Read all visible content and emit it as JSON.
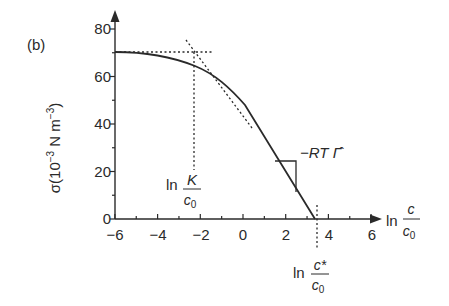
{
  "panel_label": "(b)",
  "chart_data": {
    "type": "line",
    "title": "",
    "xlabel": "ln c/c0",
    "ylabel": "σ(10^-3 N m^-3)",
    "xlim": [
      -6,
      7
    ],
    "ylim": [
      0,
      85
    ],
    "grid": false,
    "x_ticks": [
      -6,
      -4,
      -2,
      0,
      2,
      4,
      6
    ],
    "y_ticks": [
      0,
      20,
      40,
      60,
      80
    ],
    "series": [
      {
        "name": "sigma",
        "style": "solid",
        "x": [
          -6.0,
          -5.0,
          -4.0,
          -3.0,
          -2.3,
          -1.5,
          -1.0,
          0.0,
          1.0,
          2.0,
          2.5,
          3.3
        ],
        "y": [
          70.0,
          69.6,
          68.0,
          64.8,
          61.0,
          55.0,
          50.0,
          39.0,
          28.0,
          17.3,
          12.0,
          0.0
        ]
      },
      {
        "name": "plateau (sigma0)",
        "style": "dotted",
        "x": [
          -6.0,
          -1.4
        ],
        "y": [
          70.0,
          70.0
        ]
      },
      {
        "name": "tangent (slope -RT Γ̂)",
        "style": "dotted",
        "x": [
          -2.65,
          0.3
        ],
        "y": [
          75.0,
          39.0
        ]
      },
      {
        "name": "ln K/c0 marker",
        "style": "dotted",
        "x": [
          -2.3,
          -2.3
        ],
        "y": [
          0.0,
          70.0
        ]
      },
      {
        "name": "ln c*/c0 marker",
        "style": "dotted",
        "x": [
          3.4,
          3.4
        ],
        "y": [
          -6.0,
          4.0
        ]
      }
    ],
    "annotations": [
      {
        "text": "ln K/c0",
        "x": -2.3,
        "y": 20
      },
      {
        "text": "ln c*/c0",
        "x": 3.4,
        "y": -14
      },
      {
        "text": "−RT Γ̂",
        "x": 2.6,
        "y": 26,
        "note": "slope triangle"
      }
    ]
  },
  "axis_labels": {
    "y_prefix": "σ(10",
    "y_exp": "−3",
    "y_mid": " N m",
    "y_exp2": "−3",
    "y_suffix": ")",
    "x_ln": "ln",
    "x_num": "c",
    "x_den": "c",
    "x_den_sub": "0"
  },
  "tick_labels": {
    "x": [
      "−6",
      "−4",
      "−2",
      "0",
      "2",
      "4",
      "6"
    ],
    "y": [
      "0",
      "20",
      "40",
      "60",
      "80"
    ]
  },
  "annotations_text": {
    "k_ln": "ln",
    "k_num": "K",
    "k_den": "c",
    "k_den_sub": "0",
    "cs_ln": "ln",
    "cs_num": "c*",
    "cs_den": "c",
    "cs_den_sub": "0",
    "slope": "−RT Γ̂"
  }
}
